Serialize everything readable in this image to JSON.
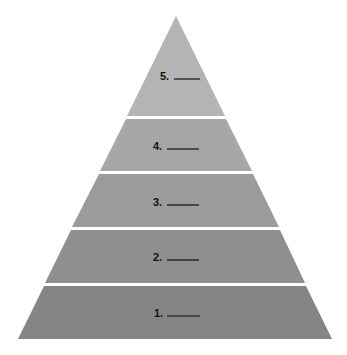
{
  "diagram": {
    "type": "pyramid",
    "levels": [
      {
        "number": "5.",
        "blank": "______",
        "color": "#b4b4b4"
      },
      {
        "number": "4.",
        "blank": "______",
        "color": "#a6a6a6"
      },
      {
        "number": "3.",
        "blank": "______",
        "color": "#9b9b9b"
      },
      {
        "number": "2.",
        "blank": "______",
        "color": "#8f8f8f"
      },
      {
        "number": "1.",
        "blank": "______",
        "color": "#858585"
      }
    ],
    "separator_color": "#ffffff"
  }
}
